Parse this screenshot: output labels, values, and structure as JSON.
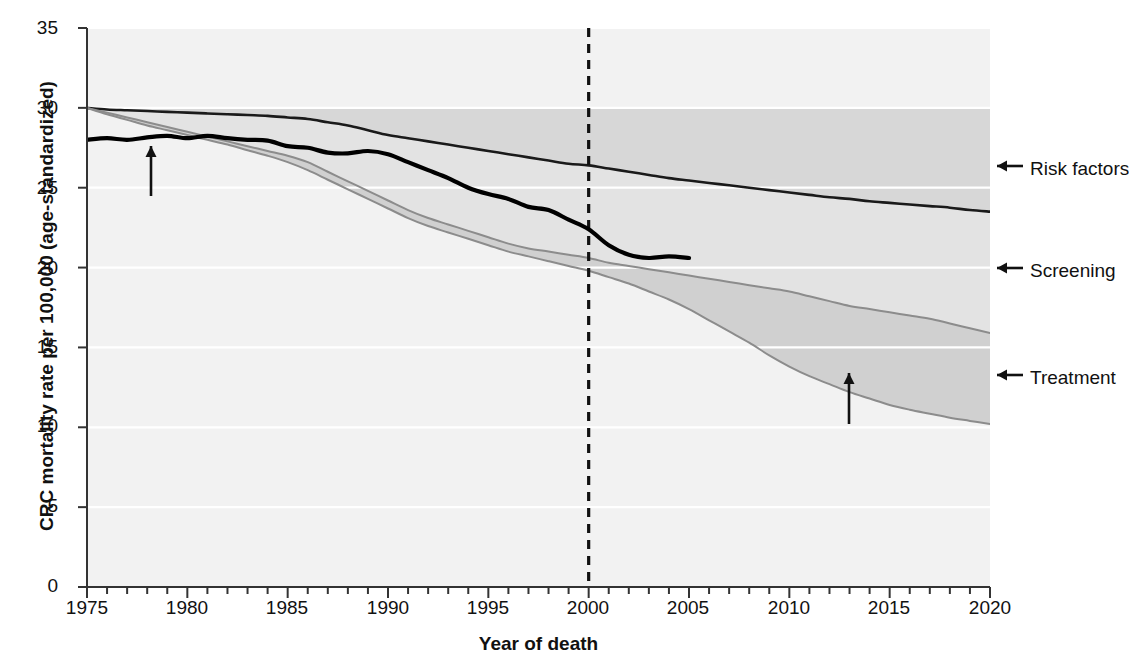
{
  "chart_data": {
    "type": "area",
    "title": "",
    "xlabel": "Year of death",
    "ylabel": "CRC mortality rate per 100,000 (age-standardized)",
    "xlim": [
      1975,
      2020
    ],
    "ylim": [
      0,
      35
    ],
    "xticks": [
      1975,
      1980,
      1985,
      1990,
      1995,
      2000,
      2005,
      2010,
      2015,
      2020
    ],
    "xtick_labels": [
      "1975",
      "1980",
      "1985",
      "1990",
      "1995",
      "2000",
      "2005",
      "2010",
      "2015",
      "2020"
    ],
    "xtick_minor_step": 1,
    "yticks": [
      0,
      5,
      10,
      15,
      20,
      25,
      30,
      35
    ],
    "ytick_labels": [
      "0",
      "5",
      "10",
      "15",
      "20",
      "25",
      "30",
      "35"
    ],
    "grid": "horizontal-white",
    "legend_position": "inline-annotations",
    "reference_line": {
      "x": 2000,
      "style": "dashed",
      "color": "#111111"
    },
    "x": [
      1975,
      1976,
      1977,
      1978,
      1979,
      1980,
      1981,
      1982,
      1983,
      1984,
      1985,
      1986,
      1987,
      1988,
      1989,
      1990,
      1991,
      1992,
      1993,
      1994,
      1995,
      1996,
      1997,
      1998,
      1999,
      2000,
      2001,
      2002,
      2003,
      2004,
      2005,
      2006,
      2007,
      2008,
      2009,
      2010,
      2011,
      2012,
      2013,
      2014,
      2015,
      2016,
      2017,
      2018,
      2019,
      2020
    ],
    "series": [
      {
        "name": "No intervention (top of Risk factors band)",
        "role": "band-top",
        "color": "#9a9a9a",
        "values": [
          30.0,
          30.0,
          30.0,
          30.0,
          30.0,
          30.0,
          30.0,
          30.0,
          30.0,
          30.0,
          30.0,
          30.0,
          30.0,
          30.0,
          30.0,
          30.0,
          30.0,
          30.0,
          30.0,
          30.0,
          30.0,
          30.0,
          30.0,
          30.0,
          30.0,
          30.0,
          30.0,
          30.0,
          30.0,
          30.0,
          30.0,
          30.0,
          30.0,
          30.0,
          30.0,
          30.0,
          30.0,
          30.0,
          30.0,
          30.0,
          30.0,
          30.0,
          30.0,
          30.0,
          30.0,
          30.0
        ]
      },
      {
        "name": "Risk factors lower boundary",
        "role": "band-line-riskfactors",
        "color": "#1a1a1a",
        "values": [
          30.0,
          29.9,
          29.85,
          29.8,
          29.75,
          29.7,
          29.65,
          29.6,
          29.55,
          29.5,
          29.4,
          29.3,
          29.1,
          28.9,
          28.6,
          28.3,
          28.1,
          27.9,
          27.7,
          27.5,
          27.3,
          27.1,
          26.9,
          26.7,
          26.5,
          26.4,
          26.2,
          26.0,
          25.8,
          25.6,
          25.45,
          25.3,
          25.15,
          25.0,
          24.85,
          24.7,
          24.55,
          24.4,
          24.3,
          24.15,
          24.05,
          23.95,
          23.85,
          23.75,
          23.6,
          23.5
        ]
      },
      {
        "name": "Screening lower boundary",
        "role": "band-line-screening",
        "color": "#8c8c8c",
        "values": [
          30.0,
          29.7,
          29.4,
          29.1,
          28.8,
          28.5,
          28.2,
          27.9,
          27.6,
          27.3,
          27.0,
          26.6,
          26.0,
          25.4,
          24.8,
          24.2,
          23.6,
          23.1,
          22.7,
          22.3,
          21.9,
          21.5,
          21.2,
          21.0,
          20.8,
          20.6,
          20.3,
          20.1,
          19.9,
          19.7,
          19.5,
          19.3,
          19.1,
          18.9,
          18.7,
          18.5,
          18.2,
          17.9,
          17.6,
          17.4,
          17.2,
          17.0,
          16.8,
          16.5,
          16.2,
          15.9
        ]
      },
      {
        "name": "US Mortality (Modeled)",
        "role": "band-line-treatment",
        "color": "#8c8c8c",
        "values": [
          30.0,
          29.6,
          29.25,
          28.9,
          28.6,
          28.3,
          28.0,
          27.7,
          27.35,
          27.0,
          26.6,
          26.1,
          25.5,
          24.9,
          24.3,
          23.7,
          23.1,
          22.6,
          22.2,
          21.8,
          21.4,
          21.0,
          20.7,
          20.4,
          20.1,
          19.8,
          19.4,
          19.0,
          18.5,
          18.0,
          17.4,
          16.7,
          16.0,
          15.3,
          14.5,
          13.8,
          13.2,
          12.7,
          12.2,
          11.8,
          11.4,
          11.1,
          10.85,
          10.6,
          10.4,
          10.2
        ]
      },
      {
        "name": "US Mortality (Observed)",
        "role": "observed",
        "color": "#000000",
        "x_end": 2005,
        "values": [
          28.0,
          28.1,
          28.0,
          28.15,
          28.25,
          28.1,
          28.25,
          28.1,
          28.0,
          27.95,
          27.6,
          27.5,
          27.2,
          27.15,
          27.3,
          27.1,
          26.6,
          26.1,
          25.6,
          25.0,
          24.6,
          24.3,
          23.8,
          23.6,
          23.0,
          22.4,
          21.4,
          20.8,
          20.6,
          20.7,
          20.6,
          20.2,
          19.5,
          18.7,
          18.0,
          null,
          null,
          null,
          null,
          null,
          null,
          null,
          null,
          null,
          null,
          null
        ]
      }
    ],
    "bands": [
      {
        "name": "Risk factors",
        "fill": "#d7d7d7",
        "between": [
          "band-top",
          "band-line-riskfactors"
        ]
      },
      {
        "name": "Screening",
        "fill": "#e3e3e3",
        "between": [
          "band-line-riskfactors",
          "band-line-screening"
        ]
      },
      {
        "name": "Treatment",
        "fill": "#d0d0d0",
        "between": [
          "band-line-screening",
          "band-line-treatment"
        ]
      }
    ],
    "annotations": [
      {
        "name": "risk-factors-label",
        "text": "Risk factors",
        "arrow": "left",
        "x": 2020,
        "y": 26.8
      },
      {
        "name": "screening-label",
        "text": "Screening",
        "arrow": "left",
        "x": 2020,
        "y": 20.1
      },
      {
        "name": "treatment-label",
        "text": "Treatment",
        "arrow": "left",
        "x": 2020,
        "y": 13.3
      },
      {
        "name": "observed-label",
        "text_lines": [
          "US Mortality",
          "(Observed)"
        ],
        "arrow": "up",
        "x": 1979.5,
        "y": 24.6
      },
      {
        "name": "modeled-label",
        "text_lines": [
          "US Mortality",
          "(Modeled)"
        ],
        "arrow": "up",
        "x": 2013,
        "y": 11.0
      }
    ]
  },
  "plot": {
    "background_color": "#f2f2f2",
    "axis_color": "#333333",
    "gridline_color": "#ffffff"
  },
  "labels": {
    "y_axis_title": "CRC mortality rate per 100,000 (age-standardized)",
    "x_axis_title": "Year of death",
    "risk_factors": "Risk factors",
    "screening": "Screening",
    "treatment": "Treatment",
    "observed_line1": "US Mortality",
    "observed_line2": "(Observed)",
    "modeled_line1": "US Mortality",
    "modeled_line2": "(Modeled)"
  },
  "yticks": {
    "t0": "0",
    "t5": "5",
    "t10": "10",
    "t15": "15",
    "t20": "20",
    "t25": "25",
    "t30": "30",
    "t35": "35"
  },
  "xticks": {
    "t1975": "1975",
    "t1980": "1980",
    "t1985": "1985",
    "t1990": "1990",
    "t1995": "1995",
    "t2000": "2000",
    "t2005": "2005",
    "t2010": "2010",
    "t2015": "2015",
    "t2020": "2020"
  }
}
